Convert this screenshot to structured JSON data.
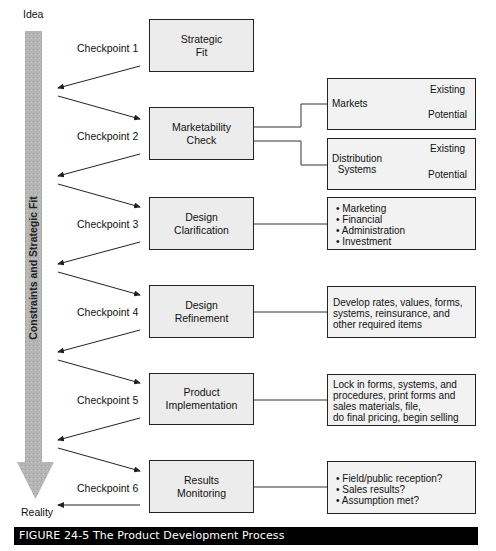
{
  "axis": {
    "top_label": "Idea",
    "bottom_label": "Reality",
    "bar_label": "Constraints and Strategic Fit"
  },
  "checkpoints": [
    {
      "label": "Checkpoint 1",
      "stage": "Strategic\nFit"
    },
    {
      "label": "Checkpoint 2",
      "stage": "Marketability\nCheck"
    },
    {
      "label": "Checkpoint 3",
      "stage": "Design\nClarification"
    },
    {
      "label": "Checkpoint 4",
      "stage": "Design\nRefinement"
    },
    {
      "label": "Checkpoint 5",
      "stage": "Product\nImplementation"
    },
    {
      "label": "Checkpoint 6",
      "stage": "Results\nMonitoring"
    }
  ],
  "details": {
    "markets": {
      "label": "Markets",
      "branches": [
        "Existing",
        "Potential"
      ]
    },
    "distribution": {
      "label": "Distribution\nSystems",
      "branches": [
        "Existing",
        "Potential"
      ]
    },
    "clarification_items": [
      "Marketing",
      "Financial",
      "Administration",
      "Investment"
    ],
    "refinement_text": "Develop rates, values, forms,\nsystems, reinsurance, and\nother required items",
    "implementation_text": "Lock in forms, systems, and\nprocedures, print forms and\nsales materials, file,\ndo final pricing, begin selling",
    "monitoring_items": [
      "Field/public reception?",
      "Sales results?",
      "Assumption met?"
    ]
  },
  "caption": "FIGURE 24-5  The Product Development Process"
}
